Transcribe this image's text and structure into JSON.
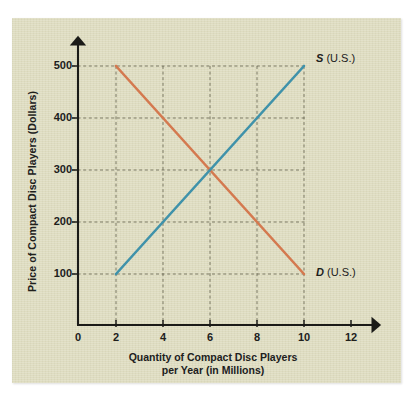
{
  "chart_data": {
    "type": "line",
    "title": "",
    "subtitle": "",
    "xlabel": "Quantity of Compact Disc Players per Year (in Millions)",
    "xlabel_line1": "Quantity of Compact Disc Players",
    "xlabel_line2": "per Year (in Millions)",
    "ylabel": "Price of Compact Disc Players (Dollars)",
    "xlim": [
      0,
      13
    ],
    "ylim": [
      0,
      560
    ],
    "xticks": [
      0,
      2,
      4,
      6,
      8,
      10,
      12
    ],
    "xtick_labels": [
      "0",
      "2",
      "4",
      "6",
      "8",
      "10",
      "12"
    ],
    "yticks": [
      100,
      200,
      300,
      400,
      500
    ],
    "ytick_labels": [
      "100",
      "200",
      "300",
      "400",
      "500"
    ],
    "grid": true,
    "grid_style": "dashed",
    "legend_position": "inline-right",
    "equilibrium": {
      "x": 6,
      "y": 300
    },
    "series": [
      {
        "name": "S (U.S.)",
        "label_italic": "S",
        "label_rest": " (U.S.)",
        "color": "#3f92aa",
        "x": [
          2,
          10
        ],
        "values": [
          100,
          500
        ],
        "points": [
          {
            "x": 2,
            "y": 100
          },
          {
            "x": 4,
            "y": 200
          },
          {
            "x": 6,
            "y": 300
          },
          {
            "x": 8,
            "y": 400
          },
          {
            "x": 10,
            "y": 500
          }
        ]
      },
      {
        "name": "D (U.S.)",
        "label_italic": "D",
        "label_rest": " (U.S.)",
        "color": "#d4794f",
        "x": [
          2,
          10
        ],
        "values": [
          500,
          100
        ],
        "points": [
          {
            "x": 2,
            "y": 500
          },
          {
            "x": 4,
            "y": 400
          },
          {
            "x": 6,
            "y": 300
          },
          {
            "x": 8,
            "y": 200
          },
          {
            "x": 10,
            "y": 100
          }
        ]
      }
    ]
  },
  "colors": {
    "panel_background": "#dedcc0",
    "page_background": "#ffffff",
    "axis": "#1b1b18",
    "grid": "#6b6854",
    "text": "#20201c",
    "supply": "#3f92aa",
    "demand": "#d4794f"
  },
  "axes": {
    "x_tick_values": [
      "0",
      "2",
      "4",
      "6",
      "8",
      "10",
      "12"
    ],
    "y_tick_values": [
      "100",
      "200",
      "300",
      "400",
      "500"
    ],
    "x_title_line1": "Quantity of Compact Disc Players",
    "x_title_line2": "per Year (in Millions)",
    "y_title": "Price of Compact Disc Players (Dollars)"
  },
  "annotations": {
    "supply_symbol": "S",
    "supply_suffix": " (U.S.)",
    "demand_symbol": "D",
    "demand_suffix": " (U.S.)"
  }
}
